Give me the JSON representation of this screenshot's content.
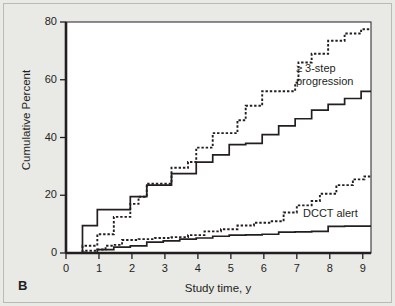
{
  "figure": {
    "panel_label": "B",
    "background_color": "#e9e9e6",
    "plot_background_color": "#ffffff",
    "axis_color": "#231f20"
  },
  "chart_data": {
    "type": "line",
    "subtype": "step",
    "title": "",
    "xlabel": "Study time, y",
    "ylabel": "Cumulative Percent",
    "xlim": [
      0,
      9.25
    ],
    "ylim": [
      0,
      80
    ],
    "xticks": [
      0,
      1,
      2,
      3,
      4,
      5,
      6,
      7,
      8,
      9
    ],
    "xtick_labels": [
      "0",
      "1",
      "2",
      "3",
      "4",
      "5",
      "6",
      "7",
      "8",
      "9"
    ],
    "yticks": [
      0,
      20,
      40,
      60,
      80
    ],
    "ytick_labels": [
      "0",
      "20",
      "40",
      "60",
      "80"
    ],
    "grid": false,
    "legend": "annotations",
    "annotations": [
      {
        "name": "progression-label",
        "text": "≥ 3-step\nprogression",
        "line1": "≥ 3-step",
        "line2": "progression",
        "x": 6.9,
        "y": 64
      },
      {
        "name": "dcct-label",
        "text": "DCCT alert",
        "x": 7.1,
        "y": 17
      }
    ],
    "series": [
      {
        "name": "≥ 3-step progression, dotted",
        "style": "dotted",
        "group": "progression",
        "points": [
          [
            0.0,
            0
          ],
          [
            0.5,
            0
          ],
          [
            0.5,
            2.5
          ],
          [
            0.95,
            2.5
          ],
          [
            0.95,
            6.5
          ],
          [
            1.45,
            6.5
          ],
          [
            1.45,
            12.5
          ],
          [
            1.95,
            12.5
          ],
          [
            1.95,
            17
          ],
          [
            2.2,
            17
          ],
          [
            2.2,
            19.5
          ],
          [
            2.45,
            19.5
          ],
          [
            2.45,
            24
          ],
          [
            2.95,
            24
          ],
          [
            2.95,
            24
          ],
          [
            3.2,
            24
          ],
          [
            3.2,
            29.5
          ],
          [
            3.7,
            29.5
          ],
          [
            3.7,
            31.5
          ],
          [
            3.95,
            31.5
          ],
          [
            3.95,
            36.5
          ],
          [
            4.45,
            36.5
          ],
          [
            4.45,
            41.5
          ],
          [
            4.95,
            41.5
          ],
          [
            4.95,
            41.5
          ],
          [
            5.2,
            41.5
          ],
          [
            5.2,
            46
          ],
          [
            5.45,
            46
          ],
          [
            5.45,
            51
          ],
          [
            5.95,
            51
          ],
          [
            5.95,
            56
          ],
          [
            6.45,
            56
          ],
          [
            6.45,
            56
          ],
          [
            6.95,
            56
          ],
          [
            6.95,
            59
          ],
          [
            7.05,
            59
          ],
          [
            7.05,
            66
          ],
          [
            7.45,
            66
          ],
          [
            7.45,
            69
          ],
          [
            7.95,
            69
          ],
          [
            7.95,
            73.5
          ],
          [
            8.45,
            73.5
          ],
          [
            8.45,
            76
          ],
          [
            8.95,
            76
          ],
          [
            8.95,
            77.5
          ],
          [
            9.25,
            77.5
          ]
        ]
      },
      {
        "name": "≥ 3-step progression, solid",
        "style": "solid",
        "group": "progression",
        "points": [
          [
            0.0,
            0
          ],
          [
            0.5,
            0
          ],
          [
            0.5,
            9.5
          ],
          [
            0.95,
            9.5
          ],
          [
            0.95,
            15
          ],
          [
            1.45,
            15
          ],
          [
            1.45,
            15
          ],
          [
            1.95,
            15
          ],
          [
            1.95,
            19.5
          ],
          [
            2.45,
            19.5
          ],
          [
            2.45,
            23.5
          ],
          [
            2.95,
            23.5
          ],
          [
            2.95,
            23.5
          ],
          [
            3.2,
            23.5
          ],
          [
            3.2,
            27.5
          ],
          [
            3.7,
            27.5
          ],
          [
            3.7,
            27.5
          ],
          [
            3.95,
            27.5
          ],
          [
            3.95,
            31.5
          ],
          [
            4.45,
            31.5
          ],
          [
            4.45,
            34
          ],
          [
            4.95,
            34
          ],
          [
            4.95,
            37.5
          ],
          [
            5.45,
            37.5
          ],
          [
            5.45,
            38
          ],
          [
            5.95,
            38
          ],
          [
            5.95,
            41
          ],
          [
            6.45,
            41
          ],
          [
            6.45,
            44
          ],
          [
            6.95,
            44
          ],
          [
            6.95,
            46.5
          ],
          [
            7.45,
            46.5
          ],
          [
            7.45,
            49.5
          ],
          [
            7.95,
            49.5
          ],
          [
            7.95,
            51.5
          ],
          [
            8.45,
            51.5
          ],
          [
            8.45,
            53.5
          ],
          [
            8.95,
            53.5
          ],
          [
            8.95,
            56
          ],
          [
            9.25,
            56
          ]
        ]
      },
      {
        "name": "DCCT alert, dotted",
        "style": "dotted",
        "group": "dcct",
        "points": [
          [
            0.0,
            0
          ],
          [
            0.55,
            0
          ],
          [
            0.55,
            0.8
          ],
          [
            0.95,
            0.8
          ],
          [
            0.95,
            1.2
          ],
          [
            1.2,
            1.2
          ],
          [
            1.2,
            2.5
          ],
          [
            1.45,
            2.5
          ],
          [
            1.45,
            2.8
          ],
          [
            1.7,
            2.8
          ],
          [
            1.7,
            4.5
          ],
          [
            2.2,
            4.5
          ],
          [
            2.2,
            4.8
          ],
          [
            2.7,
            4.8
          ],
          [
            2.7,
            5.2
          ],
          [
            3.2,
            5.2
          ],
          [
            3.2,
            5.5
          ],
          [
            3.7,
            5.5
          ],
          [
            3.7,
            6.2
          ],
          [
            4.2,
            6.2
          ],
          [
            4.2,
            7.5
          ],
          [
            4.7,
            7.5
          ],
          [
            4.7,
            8.2
          ],
          [
            5.2,
            8.2
          ],
          [
            5.2,
            9.5
          ],
          [
            5.7,
            9.5
          ],
          [
            5.7,
            10.5
          ],
          [
            6.2,
            10.5
          ],
          [
            6.2,
            11
          ],
          [
            6.6,
            11
          ],
          [
            6.6,
            14
          ],
          [
            7.0,
            14
          ],
          [
            7.0,
            16.5
          ],
          [
            7.45,
            16.5
          ],
          [
            7.45,
            18
          ],
          [
            7.7,
            18
          ],
          [
            7.7,
            20.5
          ],
          [
            8.2,
            20.5
          ],
          [
            8.2,
            23.5
          ],
          [
            8.7,
            23.5
          ],
          [
            8.7,
            25.5
          ],
          [
            9.05,
            25.5
          ],
          [
            9.05,
            26.5
          ],
          [
            9.25,
            26.5
          ]
        ]
      },
      {
        "name": "DCCT alert, solid",
        "style": "solid",
        "group": "dcct",
        "points": [
          [
            0.0,
            0
          ],
          [
            0.95,
            0
          ],
          [
            0.95,
            1.2
          ],
          [
            1.45,
            1.2
          ],
          [
            1.45,
            2
          ],
          [
            1.95,
            2
          ],
          [
            1.95,
            2.5
          ],
          [
            2.45,
            2.5
          ],
          [
            2.45,
            3.8
          ],
          [
            2.95,
            3.8
          ],
          [
            2.95,
            4.2
          ],
          [
            3.45,
            4.2
          ],
          [
            3.45,
            4.8
          ],
          [
            3.95,
            4.8
          ],
          [
            3.95,
            5.2
          ],
          [
            4.45,
            5.2
          ],
          [
            4.45,
            5.8
          ],
          [
            4.95,
            5.8
          ],
          [
            4.95,
            6.2
          ],
          [
            5.45,
            6.2
          ],
          [
            5.45,
            6.3
          ],
          [
            5.95,
            6.3
          ],
          [
            5.95,
            6.5
          ],
          [
            6.45,
            6.5
          ],
          [
            6.45,
            7.2
          ],
          [
            6.95,
            7.2
          ],
          [
            6.95,
            7.3
          ],
          [
            7.45,
            7.3
          ],
          [
            7.45,
            7.5
          ],
          [
            7.95,
            7.5
          ],
          [
            7.95,
            9.2
          ],
          [
            8.45,
            9.2
          ],
          [
            8.45,
            9.3
          ],
          [
            9.25,
            9.3
          ]
        ]
      }
    ]
  }
}
